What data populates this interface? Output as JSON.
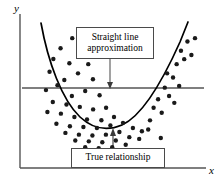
{
  "figure": {
    "width": 221,
    "height": 187,
    "background_color": "#ffffff"
  },
  "axes": {
    "y_label": "y",
    "x_label": "x",
    "line_color": "#555555",
    "y_axis_x": 20,
    "x_axis_y": 168,
    "x_axis_end": 206,
    "y_axis_top": 14
  },
  "annotations": [
    {
      "name": "straight-line-approximation",
      "text": "Straight line\napproximation",
      "box": {
        "left": 76,
        "top": 27,
        "width": 78,
        "height": 32
      },
      "arrow": {
        "from_x": 110,
        "from_y": 59,
        "to_x": 110,
        "to_y": 88,
        "direction": "down"
      },
      "border_color": "#4a4a4a"
    },
    {
      "name": "true-relationship",
      "text": "True relationship",
      "box": {
        "left": 71,
        "top": 148,
        "width": 94,
        "height": 20
      },
      "arrow": {
        "from_x": 113,
        "from_y": 148,
        "to_x": 113,
        "to_y": 129,
        "direction": "up"
      },
      "border_color": "#4a4a4a"
    }
  ],
  "chart_data": {
    "type": "scatter",
    "title": "",
    "xlabel": "x",
    "ylabel": "y",
    "xlim": [
      0,
      1
    ],
    "ylim": [
      0,
      1
    ],
    "grid": false,
    "legend": null,
    "series": [
      {
        "name": "Observed data points",
        "type": "scatter",
        "marker": "filled-circle",
        "marker_color": "#1a1a1a",
        "marker_size": 2.2,
        "points": [
          [
            0.268,
            0.862
          ],
          [
            0.203,
            0.793
          ],
          [
            0.318,
            0.776
          ],
          [
            0.163,
            0.719
          ],
          [
            0.252,
            0.69
          ],
          [
            0.357,
            0.684
          ],
          [
            0.142,
            0.632
          ],
          [
            0.3,
            0.621
          ],
          [
            0.224,
            0.575
          ],
          [
            0.383,
            0.58
          ],
          [
            0.186,
            0.54
          ],
          [
            0.122,
            0.506
          ],
          [
            0.34,
            0.5
          ],
          [
            0.266,
            0.466
          ],
          [
            0.42,
            0.471
          ],
          [
            0.16,
            0.425
          ],
          [
            0.236,
            0.408
          ],
          [
            0.31,
            0.391
          ],
          [
            0.384,
            0.374
          ],
          [
            0.13,
            0.356
          ],
          [
            0.205,
            0.345
          ],
          [
            0.456,
            0.385
          ],
          [
            0.28,
            0.322
          ],
          [
            0.35,
            0.305
          ],
          [
            0.43,
            0.3
          ],
          [
            0.5,
            0.322
          ],
          [
            0.18,
            0.276
          ],
          [
            0.255,
            0.259
          ],
          [
            0.33,
            0.253
          ],
          [
            0.405,
            0.247
          ],
          [
            0.48,
            0.264
          ],
          [
            0.55,
            0.282
          ],
          [
            0.23,
            0.213
          ],
          [
            0.305,
            0.201
          ],
          [
            0.38,
            0.195
          ],
          [
            0.455,
            0.201
          ],
          [
            0.53,
            0.219
          ],
          [
            0.605,
            0.247
          ],
          [
            0.285,
            0.161
          ],
          [
            0.36,
            0.155
          ],
          [
            0.435,
            0.149
          ],
          [
            0.51,
            0.161
          ],
          [
            0.585,
            0.184
          ],
          [
            0.655,
            0.224
          ],
          [
            0.34,
            0.115
          ],
          [
            0.415,
            0.109
          ],
          [
            0.49,
            0.115
          ],
          [
            0.565,
            0.132
          ],
          [
            0.64,
            0.172
          ],
          [
            0.7,
            0.299
          ],
          [
            0.72,
            0.385
          ],
          [
            0.745,
            0.443
          ],
          [
            0.69,
            0.236
          ],
          [
            0.765,
            0.351
          ],
          [
            0.782,
            0.523
          ],
          [
            0.806,
            0.466
          ],
          [
            0.828,
            0.592
          ],
          [
            0.848,
            0.684
          ],
          [
            0.795,
            0.621
          ],
          [
            0.872,
            0.776
          ],
          [
            0.89,
            0.718
          ],
          [
            0.908,
            0.839
          ],
          [
            0.93,
            0.747
          ],
          [
            0.862,
            0.535
          ],
          [
            0.95,
            0.862
          ],
          [
            0.835,
            0.419
          ],
          [
            0.76,
            0.178
          ],
          [
            0.63,
            0.092
          ],
          [
            0.555,
            0.086
          ],
          [
            0.47,
            0.08
          ],
          [
            0.395,
            0.075
          ],
          [
            0.31,
            0.092
          ]
        ]
      },
      {
        "name": "True relationship (quadratic)",
        "type": "line",
        "line_color": "#000000",
        "line_width": 1.6,
        "description": "Downward-opening-then-rising U-shaped curve (parabola) with minimum near x=0.50",
        "vertex": [
          0.5,
          0.142
        ],
        "points": [
          [
            0.185,
            0.905
          ],
          [
            0.215,
            0.76
          ],
          [
            0.25,
            0.63
          ],
          [
            0.29,
            0.51
          ],
          [
            0.335,
            0.408
          ],
          [
            0.38,
            0.325
          ],
          [
            0.425,
            0.252
          ],
          [
            0.465,
            0.19
          ],
          [
            0.5,
            0.142
          ],
          [
            0.54,
            0.15
          ],
          [
            0.58,
            0.186
          ],
          [
            0.62,
            0.24
          ],
          [
            0.665,
            0.32
          ],
          [
            0.705,
            0.412
          ],
          [
            0.745,
            0.52
          ],
          [
            0.785,
            0.64
          ],
          [
            0.82,
            0.76
          ],
          [
            0.855,
            0.88
          ],
          [
            0.875,
            0.95
          ]
        ]
      },
      {
        "name": "Straight line approximation",
        "type": "hline",
        "line_color": "#555555",
        "line_width": 1.4,
        "y_value": 0.52,
        "x_start": 0.0,
        "x_end": 1.0
      }
    ]
  }
}
